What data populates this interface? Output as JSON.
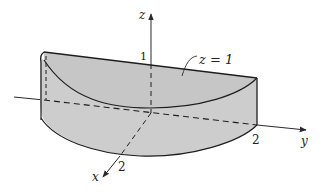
{
  "figure": {
    "colors": {
      "top_face": "#c6c6c6",
      "side_face": "#cdcdcd",
      "edge": "#1e1e1e",
      "axis": "#2a2a2a",
      "background": "#ffffff"
    },
    "axes": {
      "x": {
        "label": "x",
        "tick_label": "2"
      },
      "y": {
        "label": "y",
        "tick_label": "2"
      },
      "z": {
        "label": "z",
        "tick_label": "1"
      }
    },
    "annotation": {
      "text": "z = 1"
    }
  }
}
